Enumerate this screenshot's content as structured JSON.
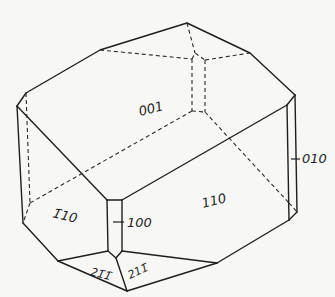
{
  "diagram": {
    "type": "crystal-morphology",
    "faces": [
      {
        "id": "f001",
        "label": "001",
        "x": 140,
        "y": 116,
        "rotate": -14
      },
      {
        "id": "f110",
        "label": "110",
        "x": 203,
        "y": 208,
        "rotate": -14
      },
      {
        "id": "f1b10",
        "label": "1̄10",
        "x": 52,
        "y": 217,
        "rotate": 14
      },
      {
        "id": "f100",
        "label": "100",
        "x": 127,
        "y": 224,
        "rotate": 0
      },
      {
        "id": "f010",
        "label": "010",
        "x": 302,
        "y": 162,
        "rotate": 0
      },
      {
        "id": "f21b1b",
        "label": "21̄1̄",
        "x": 92,
        "y": 274,
        "rotate": 14
      },
      {
        "id": "f211b",
        "label": "211̄",
        "x": 130,
        "y": 276,
        "rotate": -25
      }
    ],
    "colors": {
      "background": "#f7f7f5",
      "line": "#1e1e1e"
    }
  }
}
